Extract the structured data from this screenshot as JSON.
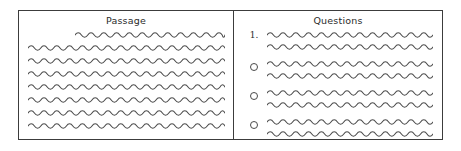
{
  "figure": {
    "type": "two-panel-schematic",
    "border_color": "#3c3c3c",
    "wave_color": "#4a4a4a",
    "background": "#ffffff"
  },
  "passage_panel": {
    "title": "Passage",
    "line_count": 8,
    "lines": [
      {
        "indent": true,
        "width_pct": 76
      },
      {
        "indent": false,
        "width_pct": 100
      },
      {
        "indent": false,
        "width_pct": 100
      },
      {
        "indent": false,
        "width_pct": 100
      },
      {
        "indent": false,
        "width_pct": 100
      },
      {
        "indent": false,
        "width_pct": 100
      },
      {
        "indent": false,
        "width_pct": 100
      },
      {
        "indent": false,
        "width_pct": 100
      }
    ]
  },
  "questions_panel": {
    "title": "Questions",
    "question_number": "1.",
    "stem_lines": 2,
    "options": [
      {
        "marker": "radio-circle",
        "selected": false,
        "line_count": 2
      },
      {
        "marker": "radio-circle",
        "selected": false,
        "line_count": 2
      },
      {
        "marker": "radio-circle",
        "selected": false,
        "line_count": 2
      }
    ]
  }
}
